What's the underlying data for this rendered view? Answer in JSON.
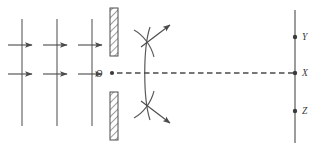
{
  "figure": {
    "background_color": "#ffffff",
    "line_color": "#4a4a4a",
    "hatch_color": "#8a8a8a",
    "label_color": "#3a3a3a",
    "width": 322,
    "height": 151
  },
  "incident_waves": {
    "label": "incident plane wavefronts",
    "wavefront_lines": [
      {
        "x": 22,
        "y_top": 19,
        "y_bottom": 126
      },
      {
        "x": 57,
        "y_top": 19,
        "y_bottom": 126
      },
      {
        "x": 92,
        "y_top": 19,
        "y_bottom": 126
      }
    ],
    "direction_arrows": [
      {
        "x_start": 8,
        "x_end": 32,
        "y": 45
      },
      {
        "x_start": 43,
        "x_end": 67,
        "y": 45
      },
      {
        "x_start": 78,
        "x_end": 102,
        "y": 45
      },
      {
        "x_start": 8,
        "x_end": 32,
        "y": 74
      },
      {
        "x_start": 43,
        "x_end": 67,
        "y": 74
      },
      {
        "x_start": 78,
        "x_end": 102,
        "y": 74
      }
    ]
  },
  "barrier": {
    "label": "opaque barrier with single slit",
    "x": 110,
    "width": 8,
    "upper": {
      "y": 8,
      "height": 48
    },
    "lower": {
      "y": 92,
      "height": 48
    }
  },
  "slit": {
    "label": "O",
    "point_x": 112,
    "point_y": 73,
    "label_x": 99,
    "label_y": 77
  },
  "diffracted_wavefront": {
    "label": "diffracted circular wavefront",
    "path": "M 150 27 C 143 48, 143 98, 150 120",
    "cross_arcs": [
      "M 134 30 C 143 35, 151 45, 154 57",
      "M 134 118 C 143 113, 151 103, 154 91"
    ],
    "arrows": [
      {
        "x_start": 141,
        "y_start": 47,
        "x_end": 170,
        "y_end": 25
      },
      {
        "x_start": 141,
        "y_start": 101,
        "x_end": 170,
        "y_end": 123
      }
    ]
  },
  "axis": {
    "label": "optical axis",
    "style": "dashed",
    "x_start": 117,
    "x_end": 295,
    "y": 73
  },
  "screen": {
    "label": "observation screen",
    "x": 295,
    "y_top": 10,
    "y_bottom": 143,
    "points": [
      {
        "id": "point-y",
        "label": "Y",
        "x": 295,
        "y": 37,
        "label_x": 302,
        "label_y": 40
      },
      {
        "id": "point-x",
        "label": "X",
        "x": 295,
        "y": 73,
        "label_x": 302,
        "label_y": 76
      },
      {
        "id": "point-z",
        "label": "Z",
        "x": 295,
        "y": 111,
        "label_x": 302,
        "label_y": 114
      }
    ]
  }
}
